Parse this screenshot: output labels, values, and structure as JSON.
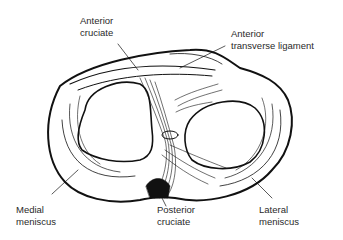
{
  "diagram": {
    "labels": {
      "anterior_cruciate": [
        "Anterior",
        "cruciate"
      ],
      "anterior_transverse_ligament": [
        "Anterior",
        "transverse ligament"
      ],
      "medial_meniscus": [
        "Medial",
        "meniscus"
      ],
      "posterior_cruciate": [
        "Posterior",
        "cruciate"
      ],
      "lateral_meniscus": [
        "Lateral",
        "meniscus"
      ]
    },
    "colors": {
      "ink": "#111111",
      "label": "#2a2a2a",
      "background": "#ffffff"
    }
  }
}
